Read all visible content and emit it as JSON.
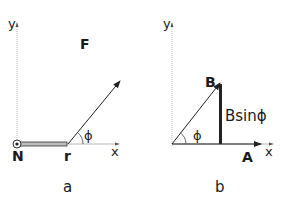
{
  "panel_a": {
    "caption": "a",
    "y_axis_label": "y",
    "x_axis_label": "x",
    "origin_label": "N",
    "lever_label": "r",
    "force_label": "F",
    "angle_label": "ϕ"
  },
  "panel_b": {
    "caption": "b",
    "y_axis_label": "y",
    "x_axis_label": "x",
    "vector_b_label": "B",
    "vector_a_label": "A",
    "component_label": "Bsinϕ",
    "angle_label": "ϕ"
  },
  "colors": {
    "axis": "#b8b8b8",
    "line": "#222222",
    "rod_fill": "#bdbdbd"
  }
}
